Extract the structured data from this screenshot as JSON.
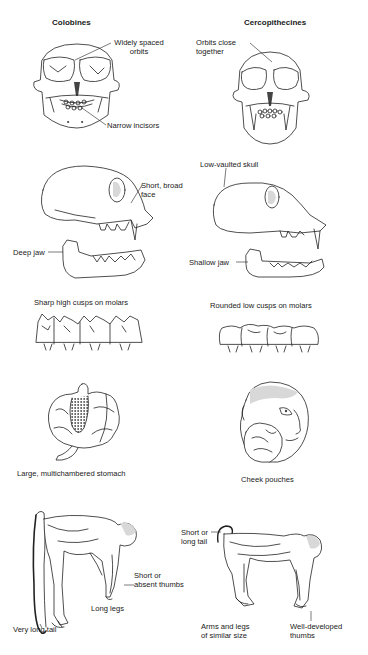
{
  "columns": {
    "left": {
      "title": "Colobines"
    },
    "right": {
      "title": "Cercopithecines"
    }
  },
  "left_labels": {
    "orbits": "Widely spaced orbits",
    "orbits_l1": "Widely spaced",
    "orbits_l2": "orbits",
    "incisors": "Narrow incisors",
    "face_l1": "Short, broad",
    "face_l2": "face",
    "jaw": "Deep jaw",
    "molars": "Sharp high cusps on molars",
    "stomach": "Large, multichambered stomach",
    "thumbs_l1": "Short or",
    "thumbs_l2": "absent thumbs",
    "legs": "Long legs",
    "tail": "Very long tail"
  },
  "right_labels": {
    "orbits_l1": "Orbits close",
    "orbits_l2": "together",
    "skull": "Low-vaulted skull",
    "jaw": "Shallow jaw",
    "molars": "Rounded low cusps on molars",
    "pouches": "Cheek pouches",
    "tail_l1": "Short or",
    "tail_l2": "long tail",
    "limbs_l1": "Arms and legs",
    "limbs_l2": "of similar size",
    "thumbs_l1": "Well-developed",
    "thumbs_l2": "thumbs"
  },
  "illustrations": {
    "colobine_skull_front": "skull-front-icon",
    "cercopithecine_skull_front": "skull-front-icon",
    "colobine_skull_side": "skull-side-icon",
    "cercopithecine_skull_side": "skull-side-icon",
    "colobine_molars": "molars-icon",
    "cercopithecine_molars": "molars-icon",
    "stomach": "stomach-icon",
    "cheek_pouch_head": "monkey-head-icon",
    "colobine_body": "monkey-body-icon",
    "cercopithecine_body": "monkey-body-icon"
  }
}
